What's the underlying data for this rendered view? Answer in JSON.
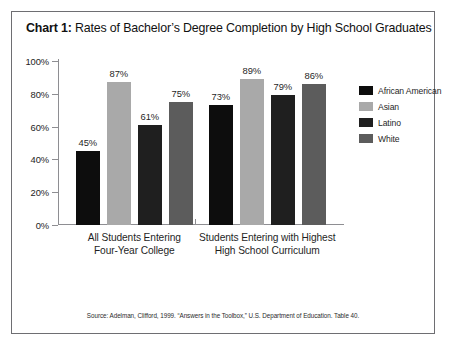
{
  "card": {
    "title_label": "Chart 1:",
    "title_text": " Rates of Bachelor’s Degree Completion by High School Graduates",
    "source": "Source: Adelman, Clifford, 1999. “Answers in the Toolbox,” U.S. Department of Education. Table 40."
  },
  "legend": {
    "items": [
      {
        "label": "African American",
        "color": "#0d0d0d"
      },
      {
        "label": "Asian",
        "color": "#a9a9a9"
      },
      {
        "label": "Latino",
        "color": "#1f1f1f"
      },
      {
        "label": "White",
        "color": "#5c5c5c"
      }
    ]
  },
  "chart_data": {
    "type": "bar",
    "title": "Chart 1: Rates of Bachelor’s Degree Completion by High School Graduates",
    "xlabel": "",
    "ylabel": "",
    "ylim": [
      0,
      100
    ],
    "yticks": [
      "0%",
      "20%",
      "40%",
      "60%",
      "80%",
      "100%"
    ],
    "ytick_values": [
      0,
      20,
      40,
      60,
      80,
      100
    ],
    "grid": false,
    "legend_position": "right",
    "categories": [
      "All Students Entering Four-Year College",
      "Students Entering with Highest High School Curriculum"
    ],
    "category_lines": [
      [
        "All Students Entering",
        "Four-Year College"
      ],
      [
        "Students Entering with Highest",
        "High School Curriculum"
      ]
    ],
    "series": [
      {
        "name": "African American",
        "color": "#0d0d0d",
        "values": [
          45,
          73
        ],
        "labels": [
          "45%",
          "73%"
        ]
      },
      {
        "name": "Asian",
        "color": "#a9a9a9",
        "values": [
          87,
          89
        ],
        "labels": [
          "87%",
          "89%"
        ]
      },
      {
        "name": "Latino",
        "color": "#1f1f1f",
        "values": [
          61,
          79
        ],
        "labels": [
          "61%",
          "79%"
        ]
      },
      {
        "name": "White",
        "color": "#5c5c5c",
        "values": [
          75,
          86
        ],
        "labels": [
          "86%",
          "86%"
        ]
      }
    ],
    "value_labels_group1": [
      "45%",
      "87%",
      "61%",
      "75%"
    ],
    "value_labels_group2": [
      "73%",
      "89%",
      "79%",
      "86%"
    ],
    "source_note": "Source: Adelman, Clifford, 1999. “Answers in the Toolbox,” U.S. Department of Education. Table 40."
  }
}
